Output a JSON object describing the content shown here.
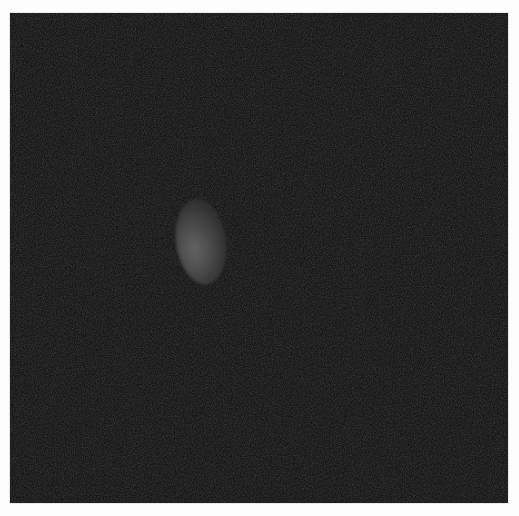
{
  "image": {
    "kind": "grayscale-scan",
    "background_color": "#fdfdfd",
    "frame": {
      "x": 10,
      "y": 13,
      "width": 498,
      "height": 490,
      "fill_color": "#151515"
    },
    "features": [
      {
        "name": "bright-elliptical-region",
        "center_x": 191,
        "center_y": 241,
        "width": 50,
        "height": 86,
        "peak_color": "#5a5a5a",
        "description": "Faint gray oval region, brighter on its left side"
      }
    ],
    "texture": "fine speckle noise"
  }
}
